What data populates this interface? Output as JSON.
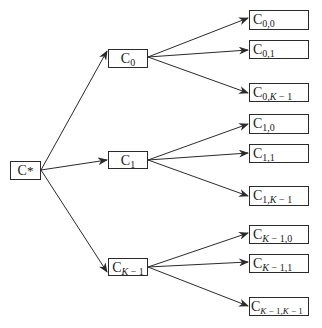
{
  "diagram": {
    "type": "tree",
    "edge_color": "#2a2a2a",
    "root": {
      "base": "C",
      "sub": "*"
    },
    "level1": [
      {
        "base": "C",
        "sub_pre": "0",
        "sub_it": "",
        "sub_post": ""
      },
      {
        "base": "C",
        "sub_pre": "1",
        "sub_it": "",
        "sub_post": ""
      },
      {
        "base": "C",
        "sub_pre": "",
        "sub_it": "K",
        "sub_post": " − 1"
      }
    ],
    "level2": [
      [
        {
          "base": "C",
          "sub_pre": "0,0",
          "sub_it": "",
          "sub_mid": "",
          "sub_it2": "",
          "sub_post": ""
        },
        {
          "base": "C",
          "sub_pre": "0,1",
          "sub_it": "",
          "sub_mid": "",
          "sub_it2": "",
          "sub_post": ""
        },
        {
          "base": "C",
          "sub_pre": "0,",
          "sub_it": "K",
          "sub_mid": " − 1",
          "sub_it2": "",
          "sub_post": ""
        }
      ],
      [
        {
          "base": "C",
          "sub_pre": "1,0",
          "sub_it": "",
          "sub_mid": "",
          "sub_it2": "",
          "sub_post": ""
        },
        {
          "base": "C",
          "sub_pre": "1,1",
          "sub_it": "",
          "sub_mid": "",
          "sub_it2": "",
          "sub_post": ""
        },
        {
          "base": "C",
          "sub_pre": "1,",
          "sub_it": "K",
          "sub_mid": " − 1",
          "sub_it2": "",
          "sub_post": ""
        }
      ],
      [
        {
          "base": "C",
          "sub_pre": "",
          "sub_it": "K",
          "sub_mid": " − 1,0",
          "sub_it2": "",
          "sub_post": ""
        },
        {
          "base": "C",
          "sub_pre": "",
          "sub_it": "K",
          "sub_mid": " − 1,1",
          "sub_it2": "",
          "sub_post": ""
        },
        {
          "base": "C",
          "sub_pre": "",
          "sub_it": "K",
          "sub_mid": " − 1,",
          "sub_it2": "K",
          "sub_post": " − 1"
        }
      ]
    ]
  }
}
